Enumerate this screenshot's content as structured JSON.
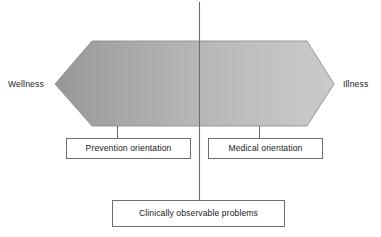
{
  "figure": {
    "type": "diagram",
    "kind": "health-illness-continuum",
    "endpoints": {
      "left_label": "Wellness",
      "right_label": "Illness"
    },
    "continuum_band": {
      "shape": "hexagon-arrow",
      "fill_left_color": "#9a9a9a",
      "fill_right_color": "#c9c9c9",
      "stroke_color": "#8a8a8a"
    },
    "divider": {
      "name": "vertical-threshold-line",
      "color": "#6b6b6b",
      "x": 199
    },
    "boxes": [
      {
        "id": "prevention",
        "label": "Prevention orientation",
        "side": "left"
      },
      {
        "id": "medical",
        "label": "Medical orientation",
        "side": "right"
      },
      {
        "id": "clinical",
        "label": "Clinically observable problems",
        "side": "center"
      }
    ],
    "colors": {
      "box_border": "#6e6e6e",
      "text": "#1a1a1a",
      "background": "#ffffff"
    }
  }
}
